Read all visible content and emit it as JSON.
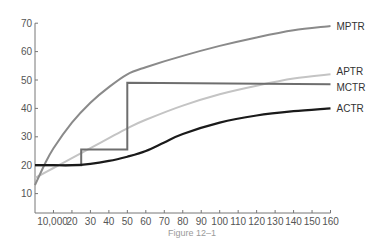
{
  "figure": {
    "caption": "Figure 12–1"
  },
  "chart_data": {
    "type": "line",
    "title": "",
    "caption": "Figure 12–1",
    "xlabel": "",
    "ylabel": "",
    "xlim": [
      0,
      160
    ],
    "ylim": [
      3,
      70
    ],
    "grid": false,
    "legend": "inline labels at right end of each line",
    "x_ticks": [
      "10,000",
      "20",
      "30",
      "40",
      "50",
      "60",
      "70",
      "80",
      "90",
      "100",
      "110",
      "120",
      "130",
      "140",
      "150",
      "160"
    ],
    "x_tick_values": [
      10,
      20,
      30,
      40,
      50,
      60,
      70,
      80,
      90,
      100,
      110,
      120,
      130,
      140,
      150,
      160
    ],
    "y_ticks": [
      "10",
      "20",
      "30",
      "40",
      "50",
      "60",
      "70"
    ],
    "y_tick_values": [
      10,
      20,
      30,
      40,
      50,
      60,
      70
    ],
    "series": [
      {
        "name": "MPTR",
        "color": "#8a8a8a",
        "x": [
          0,
          5,
          10,
          20,
          30,
          40,
          50,
          60,
          80,
          100,
          120,
          140,
          160
        ],
        "values": [
          13,
          20,
          26,
          35,
          42,
          47.5,
          52,
          54.5,
          58.5,
          62,
          65,
          67.5,
          69
        ]
      },
      {
        "name": "APTR",
        "color": "#c4c4c4",
        "x": [
          0,
          10,
          20,
          30,
          40,
          50,
          60,
          80,
          100,
          120,
          140,
          160
        ],
        "values": [
          15.5,
          19,
          22.5,
          26,
          29.5,
          33,
          36,
          41,
          45,
          48,
          50.5,
          52
        ]
      },
      {
        "name": "MCTR",
        "color": "#6e6e6e",
        "step": true,
        "x": [
          0,
          25,
          25,
          50,
          50,
          160
        ],
        "values": [
          20,
          20,
          25.5,
          25.5,
          49,
          48.5
        ]
      },
      {
        "name": "ACTR",
        "color": "#1a1a1a",
        "x": [
          0,
          10,
          20,
          30,
          40,
          50,
          60,
          70,
          80,
          100,
          120,
          140,
          160
        ],
        "values": [
          20,
          20,
          20,
          20.5,
          21.5,
          23,
          25,
          28,
          31,
          35,
          37.5,
          39,
          40
        ]
      }
    ]
  }
}
